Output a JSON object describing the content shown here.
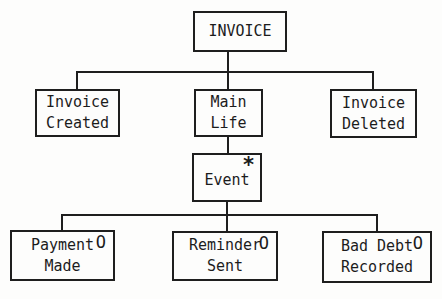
{
  "diagram": {
    "type": "tree",
    "colors": {
      "background": "#fdfdfc",
      "line": "#1e1e1e",
      "text": "#1c1c1c"
    },
    "nodes": {
      "invoice": {
        "label": "INVOICE"
      },
      "invoice_created": {
        "line1": "Invoice",
        "line2": "Created"
      },
      "main_life": {
        "line1": "Main",
        "line2": "Life"
      },
      "invoice_deleted": {
        "line1": "Invoice",
        "line2": "Deleted"
      },
      "event": {
        "label": "Event",
        "marker": "*"
      },
      "payment_made": {
        "line1": "Payment",
        "line2": "Made",
        "marker": "O"
      },
      "reminder_sent": {
        "line1": "Reminder",
        "line2": "Sent",
        "marker": "O"
      },
      "bad_debt_recorded": {
        "line1": "Bad Debt",
        "line2": "Recorded",
        "marker": "O"
      }
    }
  }
}
